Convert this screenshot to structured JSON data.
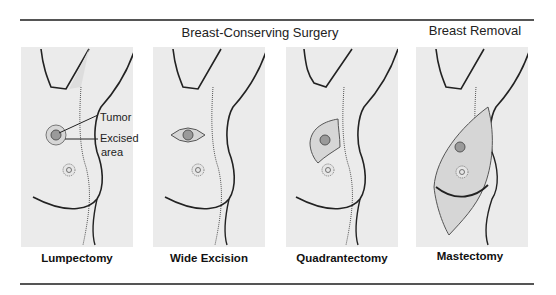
{
  "groups": [
    {
      "title": "Breast-Conserving Surgery"
    },
    {
      "title": "Breast Removal"
    }
  ],
  "panels": [
    {
      "caption": "Lumpectomy",
      "procedure": "lumpectomy"
    },
    {
      "caption": "Wide Excision",
      "procedure": "wide-excision"
    },
    {
      "caption": "Quadrantectomy",
      "procedure": "quadrantectomy"
    },
    {
      "caption": "Mastectomy",
      "procedure": "mastectomy"
    }
  ],
  "annotations": {
    "tumor": "Tumor",
    "excised_area_line1": "Excised",
    "excised_area_line2": "area"
  },
  "colors": {
    "panel_bg": "#ebebeb",
    "tumor": "#9a9a9a",
    "excised": "#d6d6d6",
    "outline": "#222222"
  }
}
